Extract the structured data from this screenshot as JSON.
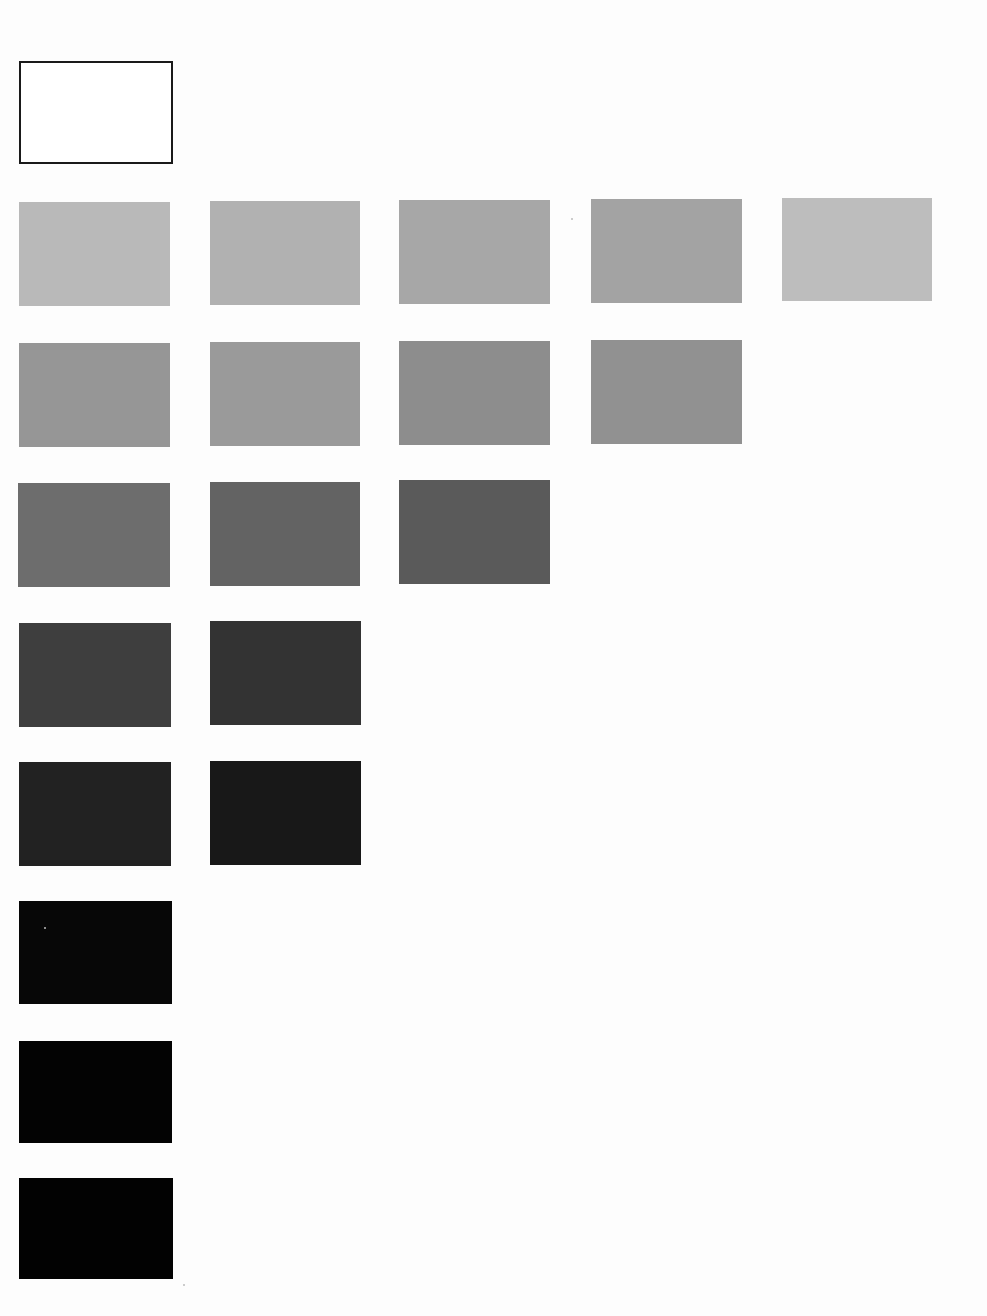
{
  "sheet": {
    "background": "#fdfdfd",
    "description": "Grayscale value swatch chart"
  },
  "swatches": [
    {
      "id": "r0c0",
      "row": 0,
      "col": 0,
      "x": 19,
      "y": 61,
      "w": 154,
      "h": 103,
      "color": "#ffffff",
      "outlined": true
    },
    {
      "id": "r1c0",
      "row": 1,
      "col": 0,
      "x": 19,
      "y": 202,
      "w": 151,
      "h": 104,
      "color": "#b9b9b9"
    },
    {
      "id": "r1c1",
      "row": 1,
      "col": 1,
      "x": 210,
      "y": 201,
      "w": 150,
      "h": 104,
      "color": "#b1b1b1"
    },
    {
      "id": "r1c2",
      "row": 1,
      "col": 2,
      "x": 399,
      "y": 200,
      "w": 151,
      "h": 104,
      "color": "#a7a7a7"
    },
    {
      "id": "r1c3",
      "row": 1,
      "col": 3,
      "x": 591,
      "y": 199,
      "w": 151,
      "h": 104,
      "color": "#a3a3a3"
    },
    {
      "id": "r1c4",
      "row": 1,
      "col": 4,
      "x": 782,
      "y": 198,
      "w": 150,
      "h": 103,
      "color": "#bdbdbd"
    },
    {
      "id": "r2c0",
      "row": 2,
      "col": 0,
      "x": 19,
      "y": 343,
      "w": 151,
      "h": 104,
      "color": "#969696"
    },
    {
      "id": "r2c1",
      "row": 2,
      "col": 1,
      "x": 210,
      "y": 342,
      "w": 150,
      "h": 104,
      "color": "#9a9a9a"
    },
    {
      "id": "r2c2",
      "row": 2,
      "col": 2,
      "x": 399,
      "y": 341,
      "w": 151,
      "h": 104,
      "color": "#8d8d8d"
    },
    {
      "id": "r2c3",
      "row": 2,
      "col": 3,
      "x": 591,
      "y": 340,
      "w": 151,
      "h": 104,
      "color": "#919191"
    },
    {
      "id": "r3c0",
      "row": 3,
      "col": 0,
      "x": 18,
      "y": 483,
      "w": 152,
      "h": 104,
      "color": "#6d6d6d"
    },
    {
      "id": "r3c1",
      "row": 3,
      "col": 1,
      "x": 210,
      "y": 482,
      "w": 150,
      "h": 104,
      "color": "#636363"
    },
    {
      "id": "r3c2",
      "row": 3,
      "col": 2,
      "x": 399,
      "y": 480,
      "w": 151,
      "h": 104,
      "color": "#5a5a5a"
    },
    {
      "id": "r4c0",
      "row": 4,
      "col": 0,
      "x": 19,
      "y": 623,
      "w": 152,
      "h": 104,
      "color": "#3e3e3e"
    },
    {
      "id": "r4c1",
      "row": 4,
      "col": 1,
      "x": 210,
      "y": 621,
      "w": 151,
      "h": 104,
      "color": "#333333"
    },
    {
      "id": "r5c0",
      "row": 5,
      "col": 0,
      "x": 19,
      "y": 762,
      "w": 152,
      "h": 104,
      "color": "#222222"
    },
    {
      "id": "r5c1",
      "row": 5,
      "col": 1,
      "x": 210,
      "y": 761,
      "w": 151,
      "h": 104,
      "color": "#181818"
    },
    {
      "id": "r6c0",
      "row": 6,
      "col": 0,
      "x": 19,
      "y": 901,
      "w": 153,
      "h": 103,
      "color": "#070707"
    },
    {
      "id": "r7c0",
      "row": 7,
      "col": 0,
      "x": 19,
      "y": 1041,
      "w": 153,
      "h": 102,
      "color": "#030303"
    },
    {
      "id": "r8c0",
      "row": 8,
      "col": 0,
      "x": 19,
      "y": 1178,
      "w": 154,
      "h": 101,
      "color": "#020202"
    }
  ],
  "specks": [
    {
      "x": 571,
      "y": 218
    },
    {
      "x": 44,
      "y": 927
    },
    {
      "x": 183,
      "y": 1284
    }
  ]
}
